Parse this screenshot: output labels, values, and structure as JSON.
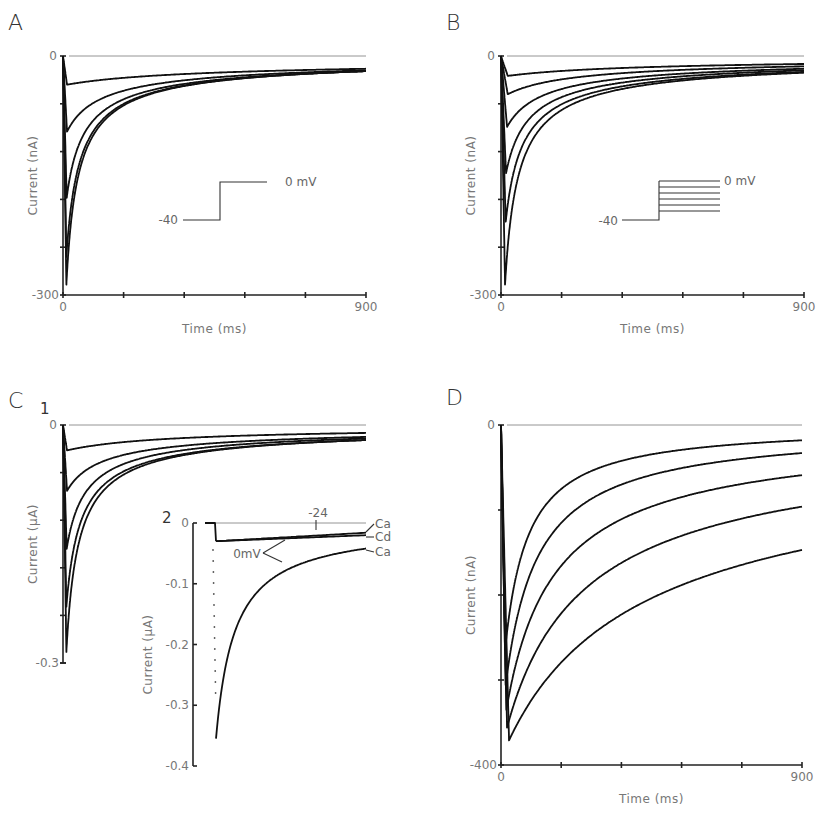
{
  "figure": {
    "panels": [
      "A",
      "B",
      "C",
      "D"
    ]
  },
  "chart_data": [
    {
      "id": "A",
      "type": "line",
      "title": "A",
      "xlabel": "Time (ms)",
      "ylabel": "Current (nA)",
      "xlim": [
        0,
        900
      ],
      "ylim": [
        -300,
        0
      ],
      "x_tick_labels": [
        "0",
        "900"
      ],
      "x_ticks": [
        0,
        180,
        360,
        540,
        720,
        900
      ],
      "y_tick_labels": [
        "0",
        "-300"
      ],
      "y_ticks": [
        0,
        -60,
        -120,
        -180,
        -240,
        -300
      ],
      "grid": false,
      "protocol": {
        "holding_label": "-40",
        "step_label": "0 mV",
        "step_levels": 1
      },
      "series": [
        {
          "name": "trace 1",
          "peak": -36,
          "t_peak": 12,
          "end": -16,
          "tau": 260
        },
        {
          "name": "trace 2",
          "peak": -95,
          "t_peak": 12,
          "end": -18,
          "tau": 70
        },
        {
          "name": "trace 3",
          "peak": -178,
          "t_peak": 11,
          "end": -19,
          "tau": 38
        },
        {
          "name": "trace 4",
          "peak": -252,
          "t_peak": 10,
          "end": -19,
          "tau": 30
        },
        {
          "name": "trace 5",
          "peak": -287,
          "t_peak": 10,
          "end": -19,
          "tau": 27
        }
      ]
    },
    {
      "id": "B",
      "type": "line",
      "title": "B",
      "xlabel": "Time (ms)",
      "ylabel": "Current (nA)",
      "xlim": [
        0,
        900
      ],
      "ylim": [
        -300,
        0
      ],
      "x_tick_labels": [
        "0",
        "900"
      ],
      "x_ticks": [
        0,
        180,
        360,
        540,
        720,
        900
      ],
      "y_tick_labels": [
        "0",
        "-300"
      ],
      "y_ticks": [
        0,
        -60,
        -120,
        -180,
        -240,
        -300
      ],
      "grid": false,
      "protocol": {
        "holding_label": "-40",
        "step_label": "0 mV",
        "step_levels": 6
      },
      "series": [
        {
          "name": "trace 1",
          "peak": -25,
          "t_peak": 20,
          "end": -10,
          "tau": 300
        },
        {
          "name": "trace 2",
          "peak": -48,
          "t_peak": 20,
          "end": -13,
          "tau": 150
        },
        {
          "name": "trace 3",
          "peak": -89,
          "t_peak": 18,
          "end": -16,
          "tau": 80
        },
        {
          "name": "trace 4",
          "peak": -147,
          "t_peak": 15,
          "end": -18,
          "tau": 50
        },
        {
          "name": "trace 5",
          "peak": -208,
          "t_peak": 14,
          "end": -20,
          "tau": 38
        },
        {
          "name": "trace 6",
          "peak": -287,
          "t_peak": 12,
          "end": -21,
          "tau": 30
        }
      ]
    },
    {
      "id": "C1",
      "type": "line",
      "title": "C 1",
      "xlabel": "",
      "ylabel": "Current (µA)",
      "xlim": [
        0,
        900
      ],
      "ylim": [
        -0.3,
        0
      ],
      "y_tick_labels": [
        "0",
        "-0.3"
      ],
      "y_ticks": [
        0,
        -0.06,
        -0.12,
        -0.18,
        -0.24,
        -0.3
      ],
      "grid": false,
      "series": [
        {
          "name": "trace 1",
          "peak": -0.032,
          "t_peak": 12,
          "end": -0.01,
          "tau": 250
        },
        {
          "name": "trace 2",
          "peak": -0.083,
          "t_peak": 12,
          "end": -0.015,
          "tau": 75
        },
        {
          "name": "trace 3",
          "peak": -0.156,
          "t_peak": 11,
          "end": -0.017,
          "tau": 42
        },
        {
          "name": "trace 4",
          "peak": -0.229,
          "t_peak": 10,
          "end": -0.019,
          "tau": 32
        },
        {
          "name": "trace 5",
          "peak": -0.286,
          "t_peak": 10,
          "end": -0.019,
          "tau": 28
        }
      ]
    },
    {
      "id": "C2",
      "type": "line",
      "title": "2",
      "xlabel": "",
      "ylabel": "Current (µA)",
      "ylim": [
        -0.4,
        0
      ],
      "y_tick_labels": [
        "0",
        "-0.1",
        "-0.2",
        "-0.3",
        "-0.4"
      ],
      "y_ticks": [
        0,
        -0.1,
        -0.2,
        -0.3,
        -0.4
      ],
      "grid": false,
      "annotations": {
        "step_label": "-24",
        "zero_label": "0mV",
        "labels": [
          "Ca",
          "Cd",
          "Ca"
        ]
      },
      "series": [
        {
          "name": "-24 mV, Ca",
          "peak": -0.03,
          "end": -0.016
        },
        {
          "name": "0 mV, Cd",
          "peak": -0.03,
          "end": -0.02
        },
        {
          "name": "0 mV, Ca",
          "peak": -0.355,
          "end": -0.042
        }
      ]
    },
    {
      "id": "D",
      "type": "line",
      "title": "D",
      "xlabel": "Time (ms)",
      "ylabel": "Current (nA)",
      "xlim": [
        0,
        900
      ],
      "ylim": [
        -400,
        0
      ],
      "x_tick_labels": [
        "0",
        "900"
      ],
      "x_ticks": [
        0,
        180,
        360,
        540,
        720,
        900
      ],
      "y_tick_labels": [
        "0",
        "-400"
      ],
      "y_ticks": [
        0,
        -100,
        -200,
        -300,
        -400
      ],
      "grid": false,
      "series": [
        {
          "name": "trace 1",
          "peak": -265,
          "t_peak": 12,
          "end": -18,
          "tau": 70
        },
        {
          "name": "trace 2",
          "peak": -306,
          "t_peak": 14,
          "end": -33,
          "tau": 90
        },
        {
          "name": "trace 3",
          "peak": -335,
          "t_peak": 16,
          "end": -59,
          "tau": 120
        },
        {
          "name": "trace 4",
          "peak": -356,
          "t_peak": 18,
          "end": -96,
          "tau": 180
        },
        {
          "name": "trace 5",
          "peak": -371,
          "t_peak": 24,
          "end": -147,
          "tau": 300
        }
      ]
    }
  ]
}
